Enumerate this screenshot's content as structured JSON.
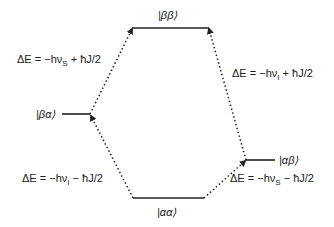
{
  "diagram": {
    "type": "energy-level-diagram",
    "levels": [
      {
        "id": "bb",
        "label": "|ββ⟩",
        "x1": 132,
        "x2": 209,
        "y": 28
      },
      {
        "id": "ba",
        "label": "|βα⟩",
        "x1": 62,
        "x2": 90,
        "y": 114
      },
      {
        "id": "ab",
        "label": "|αβ⟩",
        "x1": 246,
        "x2": 275,
        "y": 160
      },
      {
        "id": "aa",
        "label": "|αα⟩",
        "x1": 133,
        "x2": 204,
        "y": 198
      }
    ],
    "transitions": [
      {
        "from": "ba",
        "to": "bb",
        "label": "ΔE = −hν_S + ħJ/2",
        "label_main": "ΔE = −hν",
        "sub": "S",
        "label_tail": " + ħJ/2"
      },
      {
        "from": "aa",
        "to": "ba",
        "label": "ΔE = −hν_I − ħJ/2",
        "label_main": "ΔE = −hν",
        "sub": "I",
        "label_tail": " − ħJ/2"
      },
      {
        "from": "ab",
        "to": "bb",
        "label": "ΔE = −hν_I + ħJ/2",
        "label_main": "ΔE = −hν",
        "sub": "I",
        "label_tail": " + ħJ/2"
      },
      {
        "from": "aa",
        "to": "ab",
        "label": "ΔE = −hν_S − ħJ/2",
        "label_main": "ΔE = −hν",
        "sub": "S",
        "label_tail": " − ħJ/2"
      }
    ],
    "colors": {
      "line": "#222222",
      "text": "#222222",
      "background": "#ffffff"
    }
  }
}
